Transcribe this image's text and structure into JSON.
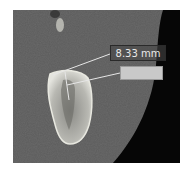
{
  "image": {
    "description": "CT cross-section of a tooth root in bone with measurement annotation",
    "measurement": {
      "value": "8.33 mm"
    },
    "colors": {
      "background": "#5a5a5a",
      "bone": "#d8d8d0",
      "dark_region": "#050505",
      "line": "#e0e0e0",
      "label_box_fill": "#c9c9c9"
    }
  }
}
